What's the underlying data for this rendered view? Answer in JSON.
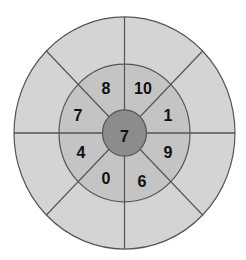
{
  "diagram": {
    "type": "radial-segmented-target",
    "colors": {
      "outer_ring": "#d4d4d4",
      "middle_ring": "#c4c4c4",
      "center": "#8c8c8c",
      "lines": "#555555",
      "text": "#111111"
    },
    "center_value": "7",
    "middle_ring_segments": [
      {
        "position": "north-north-east",
        "value": "10"
      },
      {
        "position": "east-north-east",
        "value": "1"
      },
      {
        "position": "east-south-east",
        "value": "9"
      },
      {
        "position": "south-south-east",
        "value": "6"
      },
      {
        "position": "south-south-west",
        "value": "0"
      },
      {
        "position": "west-south-west",
        "value": "4"
      },
      {
        "position": "west-north-west",
        "value": "7"
      },
      {
        "position": "north-north-west",
        "value": "8"
      }
    ],
    "outer_ring_segments": 8
  }
}
